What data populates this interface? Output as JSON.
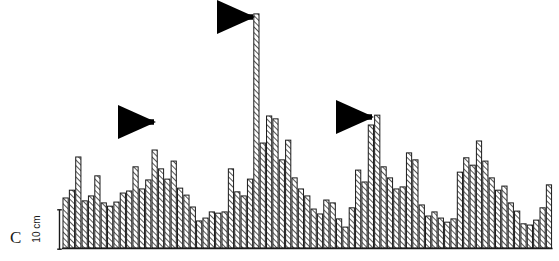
{
  "figure": {
    "panel_label": "C",
    "background_color": "#ffffff",
    "ink_color": "#1a1a1a",
    "hatch_color": "#2b2b2b"
  },
  "scale_bar": {
    "label": "10 cm",
    "value": 10,
    "unit": "cm",
    "pixel_length": 41,
    "orientation": "vertical",
    "label_rotation_deg": -90
  },
  "annotations": [
    {
      "name": "arrow-1",
      "glyph": "right-arrow",
      "tip_x": 160,
      "tip_y": 122,
      "color": "#000000",
      "points_to_bar_index": 15
    },
    {
      "name": "arrow-2",
      "glyph": "right-arrow",
      "tip_x": 259,
      "tip_y": 17,
      "color": "#000000",
      "points_to_bar_index": 31
    },
    {
      "name": "arrow-3",
      "glyph": "right-arrow",
      "tip_x": 378,
      "tip_y": 117,
      "color": "#000000",
      "points_to_bar_index": 50
    }
  ],
  "chart_data": {
    "type": "bar",
    "title": "",
    "subtitle": "",
    "xlabel": "",
    "ylabel": "",
    "legend": [],
    "grid": false,
    "axis_visible": false,
    "baseline_y_px": 248,
    "plot_left_px": 63,
    "bar_width_px": 5.2,
    "bar_pitch_px": 6.36,
    "y_unit": "cm",
    "y_px_per_unit": 4.1,
    "ylim": [
      0,
      58
    ],
    "categories": [
      "1",
      "2",
      "3",
      "4",
      "5",
      "6",
      "7",
      "8",
      "9",
      "10",
      "11",
      "12",
      "13",
      "14",
      "15",
      "16",
      "17",
      "18",
      "19",
      "20",
      "21",
      "22",
      "23",
      "24",
      "25",
      "26",
      "27",
      "28",
      "29",
      "30",
      "31",
      "32",
      "33",
      "34",
      "35",
      "36",
      "37",
      "38",
      "39",
      "40",
      "41",
      "42",
      "43",
      "44",
      "45",
      "46",
      "47",
      "48",
      "49",
      "50",
      "51",
      "52",
      "53",
      "54",
      "55",
      "56",
      "57",
      "58",
      "59",
      "60",
      "61",
      "62",
      "63",
      "64",
      "65",
      "66",
      "67",
      "68",
      "69",
      "70",
      "71",
      "72",
      "73",
      "74",
      "75",
      "76",
      "77"
    ],
    "values": [
      12.2,
      14.1,
      22.2,
      11.5,
      12.7,
      17.6,
      11.0,
      10.2,
      11.2,
      13.4,
      13.9,
      19.8,
      14.4,
      16.6,
      23.9,
      19.3,
      16.8,
      21.2,
      14.6,
      12.9,
      10.0,
      6.6,
      7.3,
      8.8,
      8.5,
      8.8,
      19.3,
      13.7,
      12.7,
      16.8,
      57.1,
      25.6,
      32.2,
      31.5,
      21.5,
      26.3,
      17.1,
      14.4,
      12.7,
      9.5,
      8.3,
      11.7,
      11.0,
      7.1,
      5.1,
      9.8,
      19.0,
      16.1,
      30.0,
      32.4,
      19.8,
      17.1,
      14.4,
      14.9,
      23.2,
      21.5,
      10.5,
      7.8,
      8.8,
      7.3,
      6.3,
      7.1,
      18.5,
      22.0,
      20.2,
      26.1,
      21.2,
      17.1,
      14.1,
      15.1,
      11.0,
      9.0,
      5.9,
      5.6,
      6.8,
      9.8,
      15.4
    ]
  }
}
